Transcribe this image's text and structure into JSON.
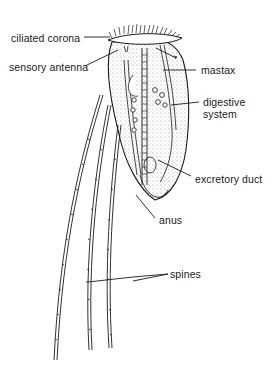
{
  "figure": {
    "labels": [
      {
        "id": "ciliated-corona",
        "text": "ciliated corona"
      },
      {
        "id": "sensory-antenna",
        "text": "sensory antenna"
      },
      {
        "id": "mastax",
        "text": "mastax"
      },
      {
        "id": "digestive-system-line1",
        "text": "digestive"
      },
      {
        "id": "digestive-system-line2",
        "text": "system"
      },
      {
        "id": "excretory-duct",
        "text": "excretory duct"
      },
      {
        "id": "anus",
        "text": "anus"
      },
      {
        "id": "spines",
        "text": "spines"
      }
    ],
    "colors": {
      "ink": "#1a1a1a",
      "background": "#ffffff"
    }
  }
}
